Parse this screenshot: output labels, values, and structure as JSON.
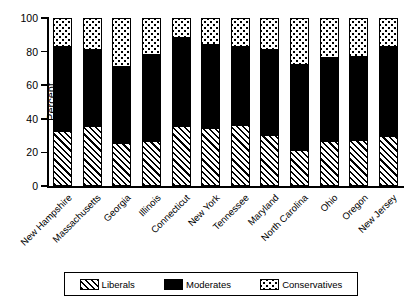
{
  "chart_data": {
    "type": "bar",
    "subtype": "stacked-vertical-100",
    "title": "",
    "xlabel": "",
    "ylabel": "Percent",
    "ylim": [
      0,
      100
    ],
    "yticks": [
      0,
      20,
      40,
      60,
      80,
      100
    ],
    "ytick_labels": [
      "0",
      "20",
      "40",
      "60",
      "80",
      "100"
    ],
    "grid": false,
    "legend_position": "bottom",
    "categories": [
      "New Hampshire",
      "Massachusetts",
      "Georgia",
      "Illinois",
      "Connecticut",
      "New York",
      "Tennessee",
      "Maryland",
      "North Carolina",
      "Ohio",
      "Oregon",
      "New Jersey"
    ],
    "series": [
      {
        "name": "Liberals",
        "fill": "diagonal-hatch",
        "values": [
          32,
          35,
          25,
          26,
          35,
          34,
          36,
          30,
          21,
          26,
          27,
          29
        ]
      },
      {
        "name": "Moderates",
        "fill": "solid-black",
        "values": [
          51,
          46,
          46,
          52,
          53,
          50,
          47,
          51,
          51,
          50,
          50,
          54
        ]
      },
      {
        "name": "Conservatives",
        "fill": "dotted",
        "values": [
          17,
          19,
          29,
          22,
          12,
          16,
          17,
          19,
          28,
          24,
          23,
          17
        ]
      }
    ],
    "legend": [
      {
        "label": "Liberals",
        "fill": "diagonal-hatch"
      },
      {
        "label": "Moderates",
        "fill": "solid-black"
      },
      {
        "label": "Conservatives",
        "fill": "dotted"
      }
    ]
  }
}
